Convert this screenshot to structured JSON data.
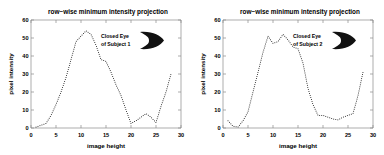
{
  "figure": {
    "background": "#ffffff",
    "axis_color": "#8a8a8a",
    "marker_color": "#000000"
  },
  "panels": [
    {
      "id": "left-panel",
      "title": "row−wise minimum intensity projection",
      "xlabel": "image height",
      "ylabel": "pixel intensity",
      "annotation_line1": "Closed Eye",
      "annotation_line2": "of Subject 1",
      "annotation_icon": "closed-eye-thumbnail"
    },
    {
      "id": "right-panel",
      "title": "row−wise minimum intensity projection",
      "xlabel": "image height",
      "ylabel": "pixel intensity",
      "annotation_line1": "Closed Eye",
      "annotation_line2": "of Subject 2",
      "annotation_icon": "closed-eye-thumbnail"
    }
  ],
  "chart_data": [
    {
      "type": "line",
      "title": "row−wise minimum intensity projection",
      "xlabel": "image height",
      "ylabel": "pixel intensity",
      "xlim": [
        0,
        30
      ],
      "ylim": [
        0,
        60
      ],
      "xticks": [
        0,
        5,
        10,
        15,
        20,
        25,
        30
      ],
      "yticks": [
        0,
        10,
        20,
        30,
        40,
        50,
        60
      ],
      "grid": false,
      "legend": "none",
      "linestyle": "dotted",
      "series": [
        {
          "name": "Closed Eye of Subject 1",
          "x": [
            1,
            2,
            3,
            4,
            5,
            6,
            7,
            8,
            9,
            10,
            11,
            12,
            13,
            14,
            15,
            16,
            17,
            18,
            19,
            20,
            21,
            22,
            23,
            24,
            25,
            26,
            27,
            28
          ],
          "values": [
            0.5,
            1.5,
            2.5,
            7,
            13,
            20,
            28,
            38,
            48,
            51,
            54,
            52,
            46,
            38,
            37,
            31,
            24,
            18,
            10,
            2.5,
            4,
            6,
            8,
            6,
            3,
            12,
            20,
            30
          ]
        }
      ]
    },
    {
      "type": "line",
      "title": "row−wise minimum intensity projection",
      "xlabel": "image height",
      "ylabel": "pixel intensity",
      "xlim": [
        0,
        30
      ],
      "ylim": [
        0,
        60
      ],
      "xticks": [
        0,
        5,
        10,
        15,
        20,
        25,
        30
      ],
      "yticks": [
        0,
        10,
        20,
        30,
        40,
        50,
        60
      ],
      "grid": false,
      "legend": "none",
      "linestyle": "dotted",
      "series": [
        {
          "name": "Closed Eye of Subject 2",
          "x": [
            1,
            2,
            3,
            4,
            5,
            6,
            7,
            8,
            9,
            10,
            11,
            12,
            13,
            14,
            15,
            16,
            17,
            18,
            19,
            20,
            21,
            22,
            23,
            24,
            25,
            26,
            27,
            28
          ],
          "values": [
            4,
            1,
            0.5,
            4,
            9,
            20,
            31,
            42,
            51,
            47,
            48,
            52,
            49,
            45,
            44,
            36,
            22,
            13,
            7,
            7,
            6,
            5,
            4.5,
            6,
            7,
            8,
            18,
            31
          ]
        }
      ]
    }
  ]
}
